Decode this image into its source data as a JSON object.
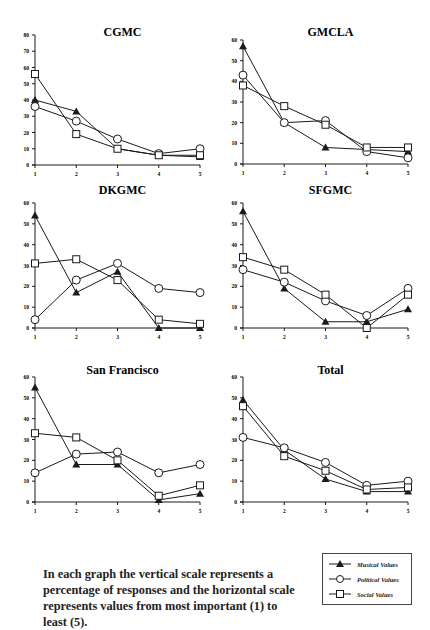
{
  "page": {
    "header_mark": "·"
  },
  "chart_data": [
    {
      "type": "line",
      "title": "CGMC",
      "x": [
        1,
        2,
        3,
        4,
        5
      ],
      "ylim": [
        0,
        80
      ],
      "yticks": [
        0,
        10,
        20,
        30,
        40,
        50,
        60,
        70,
        80
      ],
      "series": [
        {
          "name": "Musical Values",
          "marker": "triangle",
          "values": [
            40,
            33,
            10,
            6,
            5
          ]
        },
        {
          "name": "Political Values",
          "marker": "circle",
          "values": [
            36,
            27,
            16,
            7,
            10
          ]
        },
        {
          "name": "Social Values",
          "marker": "square",
          "values": [
            56,
            19,
            10,
            6,
            6
          ]
        }
      ]
    },
    {
      "type": "line",
      "title": "GMCLA",
      "x": [
        1,
        2,
        3,
        4,
        5
      ],
      "ylim": [
        0,
        60
      ],
      "yticks": [
        0,
        10,
        20,
        30,
        40,
        50,
        60
      ],
      "series": [
        {
          "name": "Musical Values",
          "marker": "triangle",
          "values": [
            57,
            20,
            8,
            7,
            6
          ]
        },
        {
          "name": "Political Values",
          "marker": "circle",
          "values": [
            43,
            20,
            21,
            6,
            3
          ]
        },
        {
          "name": "Social Values",
          "marker": "square",
          "values": [
            38,
            28,
            19,
            8,
            8
          ]
        }
      ]
    },
    {
      "type": "line",
      "title": "DKGMC",
      "x": [
        1,
        2,
        3,
        4,
        5
      ],
      "ylim": [
        0,
        60
      ],
      "yticks": [
        0,
        10,
        20,
        30,
        40,
        50,
        60
      ],
      "series": [
        {
          "name": "Musical Values",
          "marker": "triangle",
          "values": [
            54,
            17,
            27,
            0,
            0
          ]
        },
        {
          "name": "Political Values",
          "marker": "circle",
          "values": [
            4,
            23,
            31,
            19,
            17
          ]
        },
        {
          "name": "Social Values",
          "marker": "square",
          "values": [
            31,
            33,
            23,
            4,
            2
          ]
        }
      ]
    },
    {
      "type": "line",
      "title": "SFGMC",
      "x": [
        1,
        2,
        3,
        4,
        5
      ],
      "ylim": [
        0,
        60
      ],
      "yticks": [
        0,
        10,
        20,
        30,
        40,
        50,
        60
      ],
      "series": [
        {
          "name": "Musical Values",
          "marker": "triangle",
          "values": [
            56,
            19,
            3,
            3,
            9
          ]
        },
        {
          "name": "Political Values",
          "marker": "circle",
          "values": [
            28,
            22,
            13,
            6,
            19
          ]
        },
        {
          "name": "Social Values",
          "marker": "square",
          "values": [
            34,
            28,
            16,
            0,
            16
          ]
        }
      ]
    },
    {
      "type": "line",
      "title": "San Francisco",
      "x": [
        1,
        2,
        3,
        4,
        5
      ],
      "ylim": [
        0,
        60
      ],
      "yticks": [
        0,
        10,
        20,
        30,
        40,
        50,
        60
      ],
      "series": [
        {
          "name": "Musical Values",
          "marker": "triangle",
          "values": [
            55,
            18,
            18,
            1,
            4
          ]
        },
        {
          "name": "Political Values",
          "marker": "circle",
          "values": [
            14,
            23,
            24,
            14,
            18
          ]
        },
        {
          "name": "Social Values",
          "marker": "square",
          "values": [
            33,
            31,
            20,
            3,
            8
          ]
        }
      ]
    },
    {
      "type": "line",
      "title": "Total",
      "x": [
        1,
        2,
        3,
        4,
        5
      ],
      "ylim": [
        0,
        60
      ],
      "yticks": [
        0,
        10,
        20,
        30,
        40,
        50,
        60
      ],
      "series": [
        {
          "name": "Musical Values",
          "marker": "triangle",
          "values": [
            49,
            25,
            11,
            5,
            5
          ]
        },
        {
          "name": "Political Values",
          "marker": "circle",
          "values": [
            31,
            26,
            19,
            8,
            10
          ]
        },
        {
          "name": "Social Values",
          "marker": "square",
          "values": [
            46,
            22,
            15,
            6,
            7
          ]
        }
      ]
    }
  ],
  "caption": "In each graph the vertical scale represents a percentage of responses and the horizontal scale represents values from most important (1) to least (5).",
  "legend": {
    "items": [
      {
        "label": "Musical Values",
        "marker": "triangle"
      },
      {
        "label": "Political Values",
        "marker": "circle"
      },
      {
        "label": "Social Values",
        "marker": "square"
      }
    ]
  },
  "colors": {
    "line": "#1a1a1a",
    "background": "#ffffff"
  }
}
